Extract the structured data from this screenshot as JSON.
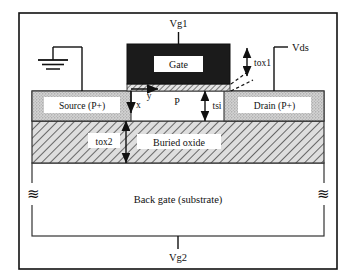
{
  "figure": {
    "type": "device-cross-section"
  },
  "terminals": {
    "gate_top": "Vg1",
    "drain": "Vds",
    "back_gate": "Vg2",
    "source_ground_icon": "ground-icon"
  },
  "regions": {
    "gate": "Gate",
    "source": "Source (P+)",
    "drain": "Drain (P+)",
    "channel": "P",
    "buried_oxide": "Buried oxide",
    "substrate": "Back gate (substrate)"
  },
  "dimensions": {
    "gate_oxide": "tox1",
    "silicon_film": "tsi",
    "buried_oxide_thickness": "tox2"
  },
  "axes": {
    "vertical": "x",
    "horizontal": "y"
  },
  "break_symbols": {
    "left": "≋",
    "right": "≋"
  },
  "colors": {
    "ink": "#111111",
    "gate_fill": "#1b1b1b",
    "gate_label_box": "#ffffff",
    "doped_fill": "#cfcfcf",
    "oxide_fill": "#d9d9d9",
    "hatch_line": "#555555",
    "page": "#ffffff"
  }
}
